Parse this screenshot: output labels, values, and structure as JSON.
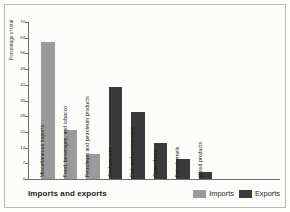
{
  "figure": {
    "title": "Imports and exports",
    "background_color": "#fcfcfa",
    "frame_color": "#b9b9b4"
  },
  "legend": {
    "position": "bottom-right",
    "items": [
      {
        "label": "Imports",
        "color": "#9a9a9a"
      },
      {
        "label": "Exports",
        "color": "#3a3a3a"
      }
    ]
  },
  "chart_data": {
    "type": "bar",
    "title": "Imports and exports",
    "xlabel": "",
    "ylabel": "Percentage of total",
    "ylim": [
      0,
      70
    ],
    "yticks": [
      0,
      7,
      14,
      21,
      28,
      35,
      42,
      49,
      56,
      63,
      70
    ],
    "ytick_labels": [
      "0",
      "7",
      "14",
      "21",
      "28",
      "35",
      "42",
      "49",
      "56",
      "63",
      "70"
    ],
    "grid": false,
    "categories": [
      "Miscellaneous imports",
      "Food, beverages, and tobacco",
      "Petroleum and petroleum products",
      "Cashew nuts",
      "Fish and crustaceans",
      "Groundnuts",
      "Palm kernels",
      "Wood products"
    ],
    "series": [
      {
        "name": "Imports",
        "color": "#9a9a9a",
        "values": [
          61,
          22,
          11,
          null,
          null,
          null,
          null,
          null
        ]
      },
      {
        "name": "Exports",
        "color": "#3a3a3a",
        "values": [
          null,
          null,
          null,
          41,
          30,
          16,
          9,
          3
        ]
      }
    ],
    "bars": [
      {
        "label": "Miscellaneous imports",
        "value": 61,
        "series": "Imports",
        "color": "#9a9a9a"
      },
      {
        "label": "Food, beverages, and tobacco",
        "value": 22,
        "series": "Imports",
        "color": "#9a9a9a"
      },
      {
        "label": "Petroleum and petroleum products",
        "value": 11,
        "series": "Imports",
        "color": "#9a9a9a"
      },
      {
        "label": "Cashew nuts",
        "value": 41,
        "series": "Exports",
        "color": "#3a3a3a"
      },
      {
        "label": "Fish and crustaceans",
        "value": 30,
        "series": "Exports",
        "color": "#3a3a3a"
      },
      {
        "label": "Groundnuts",
        "value": 16,
        "series": "Exports",
        "color": "#3a3a3a"
      },
      {
        "label": "Palm kernels",
        "value": 9,
        "series": "Exports",
        "color": "#3a3a3a"
      },
      {
        "label": "Wood products",
        "value": 3,
        "series": "Exports",
        "color": "#3a3a3a"
      }
    ]
  }
}
